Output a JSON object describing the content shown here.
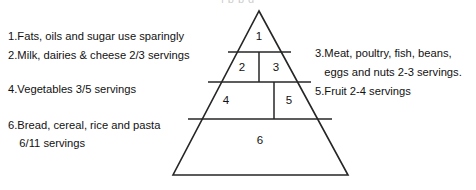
{
  "diagram": {
    "top_artifact_text": "l  p  p                                       g",
    "stroke_color": "#262626",
    "fill_color": "#ffffff",
    "text_color": "#111111"
  },
  "left_list": [
    {
      "number": "1.",
      "line1": "Fats, oils and sugar use sparingly",
      "line2": ""
    },
    {
      "number": "2.",
      "line1": "Milk, dairies & cheese 2/3 servings",
      "line2": ""
    },
    {
      "number": "4.",
      "line1": " Vegetables 3/5 servings",
      "line2": ""
    },
    {
      "number": "6.",
      "line1": "Bread, cereal, rice and pasta",
      "line2": "6/11 servings"
    }
  ],
  "right_list": [
    {
      "number": "3.",
      "line1": "Meat, poultry, fish, beans,",
      "line2": "eggs and nuts 2-3 servings."
    },
    {
      "number": "5.",
      "line1": "Fruit  2-4 servings",
      "line2": ""
    }
  ],
  "pyramid": {
    "apex": {
      "x": 259,
      "y": 11
    },
    "base_left": {
      "x": 173,
      "y": 175
    },
    "base_right": {
      "x": 348,
      "y": 175
    },
    "tiers": [
      {
        "id": "1",
        "label": "1",
        "label_x": 259,
        "label_y": 37
      },
      {
        "id": "2",
        "label": "2",
        "label_x": 242,
        "label_y": 68
      },
      {
        "id": "3",
        "label": "3",
        "label_x": 276,
        "label_y": 68
      },
      {
        "id": "4",
        "label": "4",
        "label_x": 226,
        "label_y": 101
      },
      {
        "id": "5",
        "label": "5",
        "label_x": 289,
        "label_y": 101
      },
      {
        "id": "6",
        "label": "6",
        "label_x": 260,
        "label_y": 141
      }
    ],
    "dividers_horizontal": [
      {
        "y": 52,
        "x1": 228,
        "x2": 291
      },
      {
        "y": 82,
        "x1": 208,
        "x2": 311
      },
      {
        "y": 119,
        "x1": 188,
        "x2": 332
      }
    ],
    "dividers_vertical": [
      {
        "x": 259,
        "y1": 52,
        "y2": 82
      },
      {
        "x": 274,
        "y1": 82,
        "y2": 119
      }
    ]
  }
}
